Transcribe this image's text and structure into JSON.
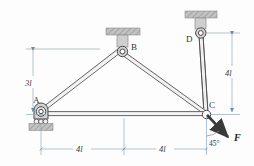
{
  "figure": {
    "type": "statics-truss-free-body-diagram",
    "background": "#fdfdfd",
    "width": 254,
    "height": 166
  },
  "joints": [
    {
      "id": "A",
      "label": "A",
      "support": "pin-on-rollers",
      "x": 40,
      "y": 114
    },
    {
      "id": "B",
      "label": "B",
      "support": "ceiling-pin",
      "x": 122,
      "y": 52
    },
    {
      "id": "C",
      "label": "C",
      "support": "free-joint",
      "x": 206,
      "y": 114
    },
    {
      "id": "D",
      "label": "D",
      "support": "ceiling-pin",
      "x": 201,
      "y": 33
    }
  ],
  "members": [
    {
      "from": "A",
      "to": "B",
      "style": "double-line"
    },
    {
      "from": "B",
      "to": "C",
      "style": "double-line"
    },
    {
      "from": "A",
      "to": "C",
      "style": "double-line"
    },
    {
      "from": "D",
      "to": "C",
      "style": "double-line"
    }
  ],
  "dimensions": {
    "vertical_left": {
      "label": "3l",
      "value": 3,
      "unit": "l",
      "from": "ceiling-level-B",
      "to": "A-level"
    },
    "vertical_right": {
      "label": "4l",
      "value": 4,
      "unit": "l",
      "from": "D-level",
      "to": "C-level"
    },
    "horizontal_left": {
      "label": "4l",
      "value": 4,
      "unit": "l",
      "from": "A",
      "to": "mid"
    },
    "horizontal_right": {
      "label": "4l",
      "value": 4,
      "unit": "l",
      "from": "mid",
      "to": "C"
    }
  },
  "load": {
    "label": "F",
    "angle_label": "45°",
    "angle_value": 45,
    "applied_at": "C",
    "direction": "down-right"
  },
  "colors": {
    "member_outline": "#4a4a4a",
    "member_fill": "#e8e8e8",
    "dimension_line": "#8fa8bf",
    "hatch_fill": "#b8b8b8",
    "support_fill": "#c9c9c9",
    "force_arrow": "#3a3a3a",
    "text": "#333333"
  }
}
